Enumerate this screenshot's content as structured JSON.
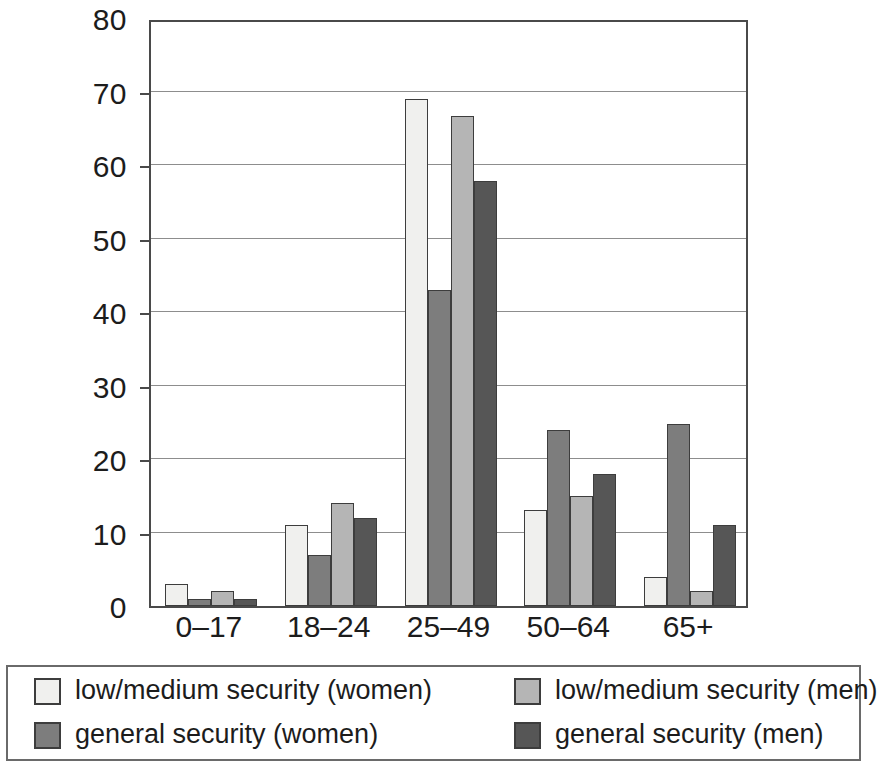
{
  "chart_data": {
    "type": "bar",
    "title": "",
    "subtitle": "",
    "xlabel": "",
    "ylabel": "",
    "categories": [
      "0–17",
      "18–24",
      "25–49",
      "50–64",
      "65+"
    ],
    "series": [
      {
        "name": "low/medium security (women)",
        "color": "#f0f0ee",
        "values": [
          3,
          11,
          69,
          13,
          4
        ]
      },
      {
        "name": "general security (women)",
        "color": "#7d7d7d",
        "values": [
          1,
          7,
          43,
          24,
          24.7
        ]
      },
      {
        "name": "low/medium security (men)",
        "color": "#b5b5b5",
        "values": [
          2,
          14,
          66.7,
          15,
          2
        ]
      },
      {
        "name": "general security (men)",
        "color": "#565656",
        "values": [
          1,
          12,
          57.8,
          18,
          11
        ]
      }
    ],
    "ylim": [
      0,
      80
    ],
    "yticks": [
      0,
      10,
      20,
      30,
      40,
      50,
      60,
      70,
      80
    ],
    "ytick_labels": [
      "0",
      "10",
      "20",
      "30",
      "40",
      "50",
      "60",
      "70",
      "80"
    ],
    "grid": true,
    "grid_axis": "y",
    "legend_position": "bottom",
    "legend_columns": 2,
    "bar_border_color": "#3d3d3d",
    "axis_color": "#4a4a4a",
    "gridline_color": "#8d8d8d",
    "background_color": "#ffffff"
  },
  "legend": {
    "items": [
      {
        "label": "low/medium security (women)",
        "color": "#f0f0ee"
      },
      {
        "label": "low/medium security (men)",
        "color": "#b5b5b5"
      },
      {
        "label": "general security (women)",
        "color": "#7d7d7d"
      },
      {
        "label": "general security (men)",
        "color": "#565656"
      }
    ]
  }
}
